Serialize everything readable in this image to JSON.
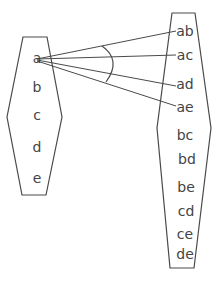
{
  "diagram": {
    "left_set": {
      "items": [
        "a",
        "b",
        "c",
        "d",
        "e"
      ]
    },
    "right_set": {
      "items": [
        "ab",
        "ac",
        "ad",
        "ae",
        "bc",
        "bd",
        "be",
        "cd",
        "ce",
        "de"
      ]
    },
    "connections": [
      {
        "from": "a",
        "to": "ab"
      },
      {
        "from": "a",
        "to": "ac"
      },
      {
        "from": "a",
        "to": "ad"
      },
      {
        "from": "a",
        "to": "ae"
      }
    ],
    "angle_arc": "arc spanning the four connection lines",
    "colors": {
      "stroke": "#4a4a4a",
      "text": "#444444",
      "background": "#ffffff"
    }
  }
}
